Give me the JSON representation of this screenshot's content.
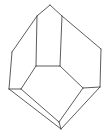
{
  "diagram": {
    "type": "crystal-line-drawing",
    "stroke_color": "#4a4a4a",
    "background": "#ffffff",
    "vertices": {
      "top": [
        50,
        5
      ],
      "top_left": [
        37,
        16
      ],
      "top_right": [
        62,
        16
      ],
      "left": [
        12,
        52
      ],
      "right": [
        101,
        49
      ],
      "mid_left": [
        36,
        66
      ],
      "mid_right": [
        60,
        66
      ],
      "outer_left": [
        9,
        89
      ],
      "inner_left": [
        21,
        89
      ],
      "outer_right": [
        100,
        87
      ],
      "inner_right": [
        83,
        88
      ],
      "inner_bottom": [
        59,
        122
      ],
      "outer_bottom": [
        61,
        129
      ]
    },
    "edges": [
      [
        "top",
        "top_left"
      ],
      [
        "top",
        "top_right"
      ],
      [
        "top_left",
        "left"
      ],
      [
        "top_right",
        "right"
      ],
      [
        "top_left",
        "mid_left"
      ],
      [
        "top_right",
        "mid_right"
      ],
      [
        "mid_left",
        "mid_right"
      ],
      [
        "left",
        "outer_left"
      ],
      [
        "right",
        "outer_right"
      ],
      [
        "mid_left",
        "inner_left"
      ],
      [
        "mid_right",
        "inner_right"
      ],
      [
        "outer_left",
        "inner_left"
      ],
      [
        "outer_right",
        "inner_right"
      ],
      [
        "inner_left",
        "inner_bottom"
      ],
      [
        "inner_right",
        "inner_bottom"
      ],
      [
        "outer_left",
        "outer_bottom"
      ],
      [
        "outer_right",
        "outer_bottom"
      ],
      [
        "inner_bottom",
        "outer_bottom"
      ]
    ]
  }
}
